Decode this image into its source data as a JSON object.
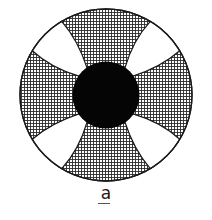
{
  "figure": {
    "label": "a",
    "label_underlined": true,
    "colors": {
      "background": "#ffffff",
      "hatch_lines": "#2a2a2a",
      "center_fill": "#050505",
      "sector_fill": "#ffffff",
      "outline": "#1a1a1a"
    },
    "geometry": {
      "outer_circle": {
        "cx": 106,
        "cy": 95,
        "r": 86
      },
      "center_circle": {
        "cx": 106,
        "cy": 95,
        "r": 33
      },
      "white_sectors": [
        {
          "position": "top-right",
          "center_angle_deg": 45
        },
        {
          "position": "bottom-right",
          "center_angle_deg": 315
        },
        {
          "position": "bottom-left",
          "center_angle_deg": 225
        },
        {
          "position": "top-left",
          "center_angle_deg": 135
        }
      ],
      "hatch_spacing_px": 3
    }
  }
}
